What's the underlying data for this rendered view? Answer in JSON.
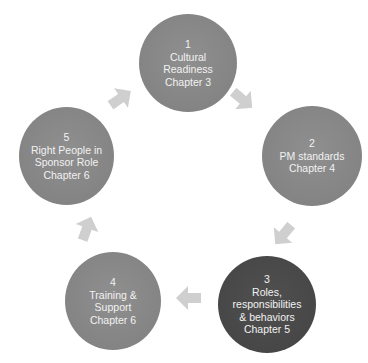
{
  "diagram": {
    "type": "cycle",
    "nodes": [
      {
        "number": "1",
        "lines": [
          "Cultural",
          "Readiness",
          "Chapter 3"
        ],
        "style": "light"
      },
      {
        "number": "2",
        "lines": [
          "PM standards",
          "Chapter 4"
        ],
        "style": "light"
      },
      {
        "number": "3",
        "lines": [
          "Roles,",
          "responsibilities",
          "& behaviors",
          "Chapter 5"
        ],
        "style": "dark"
      },
      {
        "number": "4",
        "lines": [
          "Training &",
          "Support",
          "Chapter 6"
        ],
        "style": "light"
      },
      {
        "number": "5",
        "lines": [
          "Right People in",
          "Sponsor Role",
          "Chapter 6"
        ],
        "style": "light"
      }
    ],
    "arrows": [
      {
        "from": "1",
        "to": "2",
        "icon": "arrow-down-right"
      },
      {
        "from": "2",
        "to": "3",
        "icon": "arrow-down-left"
      },
      {
        "from": "3",
        "to": "4",
        "icon": "arrow-left"
      },
      {
        "from": "4",
        "to": "5",
        "icon": "arrow-up"
      },
      {
        "from": "5",
        "to": "1",
        "icon": "arrow-up-right"
      }
    ],
    "colors": {
      "node_light": "#848484",
      "node_dark": "#474747",
      "arrow": "#cfcfcf",
      "text": "#f2f2f2"
    }
  }
}
